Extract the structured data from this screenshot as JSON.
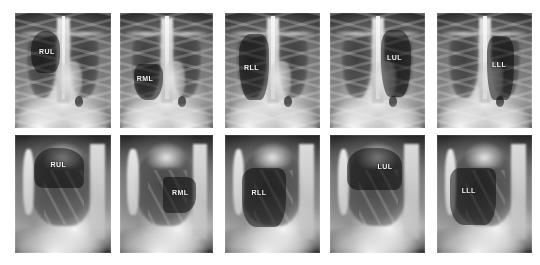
{
  "figure": {
    "background_color": "#ffffff",
    "rows": [
      {
        "name": "frontal-row",
        "view": "PA (frontal)"
      },
      {
        "name": "lateral-row",
        "view": "Lateral"
      }
    ],
    "columns": 5,
    "highlight_color": "#1a1a1e",
    "label_color": "#f2f2f2"
  },
  "panels": [
    {
      "id": "rul-frontal",
      "label": "RUL",
      "lobe_name": "Right Upper Lobe",
      "view": "frontal",
      "column": 1,
      "row": 1,
      "rect": {
        "x": 15,
        "y": 13,
        "w": 96,
        "h": 115
      },
      "highlight": {
        "left": "17%",
        "top": "16%",
        "width": "30%",
        "height": "36%",
        "radius": "48% 44% 30% 34% / 44% 40% 40% 46%"
      },
      "label_pos": {
        "left": "25%",
        "top": "30%"
      }
    },
    {
      "id": "rml-frontal",
      "label": "RML",
      "lobe_name": "Right Middle Lobe",
      "view": "frontal",
      "column": 2,
      "row": 1,
      "rect": {
        "x": 120,
        "y": 13,
        "w": 93,
        "h": 115
      },
      "highlight": {
        "left": "15%",
        "top": "44%",
        "width": "31%",
        "height": "32%",
        "radius": "22% 26% 40% 46% / 30% 26% 58% 52%"
      },
      "label_pos": {
        "left": "18%",
        "top": "54%"
      }
    },
    {
      "id": "rll-frontal",
      "label": "RLL",
      "lobe_name": "Right Lower Lobe",
      "view": "frontal",
      "column": 3,
      "row": 1,
      "rect": {
        "x": 225,
        "y": 13,
        "w": 95,
        "h": 115
      },
      "highlight": {
        "left": "15%",
        "top": "18%",
        "width": "31%",
        "height": "58%",
        "radius": "40% 30% 30% 36% / 30% 24% 56% 60%"
      },
      "label_pos": {
        "left": "20%",
        "top": "44%"
      }
    },
    {
      "id": "lul-frontal",
      "label": "LUL",
      "lobe_name": "Left Upper Lobe",
      "view": "frontal",
      "column": 4,
      "row": 1,
      "rect": {
        "x": 330,
        "y": 13,
        "w": 95,
        "h": 115
      },
      "highlight": {
        "left": "54%",
        "top": "15%",
        "width": "31%",
        "height": "58%",
        "radius": "32% 42% 34% 30% / 26% 32% 58% 56%"
      },
      "label_pos": {
        "left": "60%",
        "top": "36%"
      }
    },
    {
      "id": "lll-frontal",
      "label": "LLL",
      "lobe_name": "Left Lower Lobe",
      "view": "frontal",
      "column": 5,
      "row": 1,
      "rect": {
        "x": 437,
        "y": 13,
        "w": 95,
        "h": 115
      },
      "highlight": {
        "left": "53%",
        "top": "20%",
        "width": "28%",
        "height": "56%",
        "radius": "30% 34% 28% 26% / 24% 26% 56% 58%"
      },
      "label_pos": {
        "left": "58%",
        "top": "42%"
      }
    },
    {
      "id": "rul-lateral",
      "label": "RUL",
      "lobe_name": "Right Upper Lobe",
      "view": "lateral",
      "column": 1,
      "row": 2,
      "rect": {
        "x": 15,
        "y": 135,
        "w": 96,
        "h": 118
      },
      "highlight": {
        "left": "20%",
        "top": "11%",
        "width": "52%",
        "height": "34%",
        "radius": "40% 46% 10% 18% / 46% 40% 22% 26%"
      },
      "label_pos": {
        "left": "37%",
        "top": "22%"
      }
    },
    {
      "id": "rml-lateral",
      "label": "RML",
      "lobe_name": "Right Middle Lobe",
      "view": "lateral",
      "column": 2,
      "row": 2,
      "rect": {
        "x": 120,
        "y": 135,
        "w": 93,
        "h": 118
      },
      "highlight": {
        "left": "46%",
        "top": "36%",
        "width": "36%",
        "height": "30%",
        "radius": "10% 26% 40% 14% / 12% 26% 48% 20%"
      },
      "label_pos": {
        "left": "56%",
        "top": "46%"
      }
    },
    {
      "id": "rll-lateral",
      "label": "RLL",
      "lobe_name": "Right Lower Lobe",
      "view": "lateral",
      "column": 3,
      "row": 2,
      "rect": {
        "x": 225,
        "y": 135,
        "w": 95,
        "h": 118
      },
      "highlight": {
        "left": "18%",
        "top": "28%",
        "width": "46%",
        "height": "50%",
        "radius": "26% 18% 26% 32% / 22% 16% 46% 44%"
      },
      "label_pos": {
        "left": "28%",
        "top": "46%"
      }
    },
    {
      "id": "lul-lateral",
      "label": "LUL",
      "lobe_name": "Left Upper Lobe",
      "view": "lateral",
      "column": 4,
      "row": 2,
      "rect": {
        "x": 330,
        "y": 135,
        "w": 95,
        "h": 118
      },
      "highlight": {
        "left": "18%",
        "top": "11%",
        "width": "58%",
        "height": "36%",
        "radius": "40% 44% 12% 20% / 44% 40% 24% 26%"
      },
      "label_pos": {
        "left": "50%",
        "top": "24%"
      }
    },
    {
      "id": "lll-lateral",
      "label": "LLL",
      "lobe_name": "Left Lower Lobe",
      "view": "lateral",
      "column": 5,
      "row": 2,
      "rect": {
        "x": 437,
        "y": 135,
        "w": 95,
        "h": 118
      },
      "highlight": {
        "left": "14%",
        "top": "28%",
        "width": "48%",
        "height": "48%",
        "radius": "22% 16% 24% 30% / 20% 14% 44% 42%"
      },
      "label_pos": {
        "left": "26%",
        "top": "44%"
      }
    }
  ]
}
